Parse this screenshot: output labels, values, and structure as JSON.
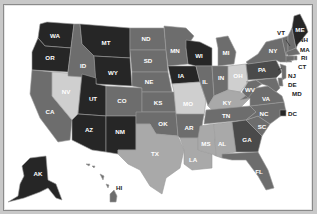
{
  "map": {
    "title": "United States choropleth map",
    "shades": {
      "darkest": "#262626",
      "dark": "#4a4a4a",
      "medium": "#6d6d6d",
      "light": "#a9a9a9",
      "lightest": "#cfcfcf"
    },
    "states": {
      "WA": {
        "label": "WA",
        "shade": "darkest"
      },
      "OR": {
        "label": "OR",
        "shade": "darkest"
      },
      "CA": {
        "label": "CA",
        "shade": "medium"
      },
      "NV": {
        "label": "NV",
        "shade": "lightest"
      },
      "ID": {
        "label": "ID",
        "shade": "medium"
      },
      "MT": {
        "label": "MT",
        "shade": "darkest"
      },
      "WY": {
        "label": "WY",
        "shade": "darkest"
      },
      "UT": {
        "label": "UT",
        "shade": "darkest"
      },
      "AZ": {
        "label": "AZ",
        "shade": "darkest"
      },
      "CO": {
        "label": "CO",
        "shade": "medium"
      },
      "NM": {
        "label": "NM",
        "shade": "darkest"
      },
      "ND": {
        "label": "ND",
        "shade": "medium"
      },
      "SD": {
        "label": "SD",
        "shade": "medium"
      },
      "NE": {
        "label": "NE",
        "shade": "medium"
      },
      "KS": {
        "label": "KS",
        "shade": "medium"
      },
      "OK": {
        "label": "OK",
        "shade": "medium"
      },
      "TX": {
        "label": "TX",
        "shade": "light"
      },
      "MN": {
        "label": "MN",
        "shade": "medium"
      },
      "IA": {
        "label": "IA",
        "shade": "darkest"
      },
      "MO": {
        "label": "MO",
        "shade": "lightest"
      },
      "AR": {
        "label": "AR",
        "shade": "medium"
      },
      "LA": {
        "label": "LA",
        "shade": "light"
      },
      "WI": {
        "label": "WI",
        "shade": "darkest"
      },
      "IL": {
        "label": "IL",
        "shade": "medium"
      },
      "MI": {
        "label": "MI",
        "shade": "medium"
      },
      "IN": {
        "label": "IN",
        "shade": "medium"
      },
      "OH": {
        "label": "OH",
        "shade": "lightest"
      },
      "KY": {
        "label": "KY",
        "shade": "light"
      },
      "TN": {
        "label": "TN",
        "shade": "medium"
      },
      "MS": {
        "label": "MS",
        "shade": "light"
      },
      "AL": {
        "label": "AL",
        "shade": "light"
      },
      "GA": {
        "label": "GA",
        "shade": "dark"
      },
      "FL": {
        "label": "FL",
        "shade": "medium"
      },
      "SC": {
        "label": "SC",
        "shade": "medium"
      },
      "NC": {
        "label": "NC",
        "shade": "medium"
      },
      "VA": {
        "label": "VA",
        "shade": "medium"
      },
      "WV": {
        "label": "WV",
        "shade": "medium"
      },
      "PA": {
        "label": "PA",
        "shade": "dark"
      },
      "NY": {
        "label": "NY",
        "shade": "medium"
      },
      "VT": {
        "label": "VT",
        "shade": "medium"
      },
      "NH": {
        "label": "NH",
        "shade": "medium"
      },
      "ME": {
        "label": "ME",
        "shade": "darkest"
      },
      "MA": {
        "label": "MA",
        "shade": "medium"
      },
      "RI": {
        "label": "RI",
        "shade": "medium"
      },
      "CT": {
        "label": "CT",
        "shade": "medium"
      },
      "NJ": {
        "label": "NJ",
        "shade": "medium"
      },
      "DE": {
        "label": "DE",
        "shade": "medium"
      },
      "MD": {
        "label": "MD",
        "shade": "medium"
      },
      "DC": {
        "label": "DC",
        "shade": "darkest"
      },
      "AK": {
        "label": "AK",
        "shade": "darkest"
      },
      "HI": {
        "label": "HI",
        "shade": "medium"
      }
    }
  }
}
